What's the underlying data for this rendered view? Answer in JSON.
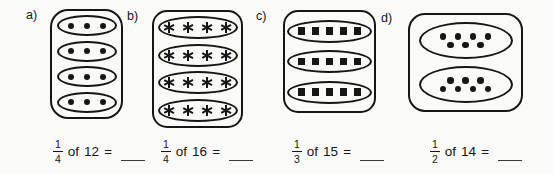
{
  "page": {
    "background": "#fafaf8",
    "ink": "#161616"
  },
  "panels": [
    {
      "label": "a)",
      "symbol": "dot",
      "groups": [
        [
          3
        ],
        [
          3
        ],
        [
          3
        ],
        [
          3
        ]
      ],
      "problem": {
        "numerator": "1",
        "denominator": "4",
        "of_word": "of",
        "total": "12",
        "equals_sign": "=",
        "answer_blank": ""
      }
    },
    {
      "label": "b)",
      "symbol": "asterisk",
      "groups": [
        [
          4
        ],
        [
          4
        ],
        [
          4
        ],
        [
          4
        ]
      ],
      "problem": {
        "numerator": "1",
        "denominator": "4",
        "of_word": "of",
        "total": "16",
        "equals_sign": "=",
        "answer_blank": ""
      }
    },
    {
      "label": "c)",
      "symbol": "square",
      "groups": [
        [
          5
        ],
        [
          5
        ],
        [
          5
        ]
      ],
      "problem": {
        "numerator": "1",
        "denominator": "3",
        "of_word": "of",
        "total": "15",
        "equals_sign": "=",
        "answer_blank": ""
      }
    },
    {
      "label": "d)",
      "symbol": "dot",
      "groups": [
        [
          4,
          3
        ],
        [
          3,
          4
        ]
      ],
      "problem": {
        "numerator": "1",
        "denominator": "2",
        "of_word": "of",
        "total": "14",
        "equals_sign": "=",
        "answer_blank": ""
      }
    }
  ]
}
